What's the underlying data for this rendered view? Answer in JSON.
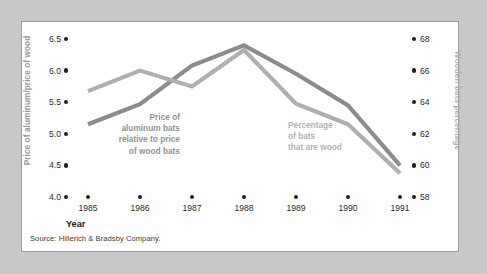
{
  "figure": {
    "background_color": "#c9c9c7",
    "panel_color": "#ffffff",
    "border_color": "#9c9c9c"
  },
  "source_note": "Source: Hillerich & Bradsby Company.",
  "x_axis_title": "Year",
  "left_axis_title": "Price of aluminum/price of wood",
  "right_axis_title": "Wooden bats percentage",
  "annotations": {
    "aluminum": "Price of\naluminum bats\nrelative to price\nof wood bats",
    "wood": "Percentage\nof bats\nthat are wood"
  },
  "ticks": {
    "left": [
      "6.5",
      "6.0",
      "5.5",
      "5.0",
      "4.5",
      "4.0"
    ],
    "right": [
      "68",
      "66",
      "64",
      "62",
      "60",
      "58"
    ],
    "x": [
      "1985",
      "1986",
      "1987",
      "1988",
      "1989",
      "1990",
      "1991"
    ]
  },
  "chart_data": {
    "type": "line",
    "title": "",
    "subtitle": "",
    "xlabel": "Year",
    "ylabel": "Price of aluminum/price of wood",
    "y2label": "Wooden bats percentage",
    "grid": false,
    "legend_position": "inline-annotations",
    "x": [
      "1985",
      "1986",
      "1987",
      "1988",
      "1989",
      "1990",
      "1991"
    ],
    "xlim": [
      "1985",
      "1991"
    ],
    "ylim": [
      4.0,
      6.5
    ],
    "y2lim": [
      58,
      68
    ],
    "yticks": [
      4.0,
      4.5,
      5.0,
      5.5,
      6.0,
      6.5
    ],
    "y2ticks": [
      58,
      60,
      62,
      64,
      66,
      68
    ],
    "series": [
      {
        "name": "Price of aluminum bats relative to price of wood bats",
        "axis": "left",
        "color": "#8c8c8c",
        "values": [
          5.15,
          5.47,
          6.08,
          6.4,
          5.95,
          5.45,
          4.5
        ]
      },
      {
        "name": "Percentage of bats that are wood",
        "axis": "right",
        "color": "#afafaf",
        "values": [
          64.7,
          66.0,
          65.0,
          67.3,
          63.9,
          62.6,
          59.5
        ]
      }
    ],
    "source": "Source: Hillerich & Bradsby Company."
  }
}
